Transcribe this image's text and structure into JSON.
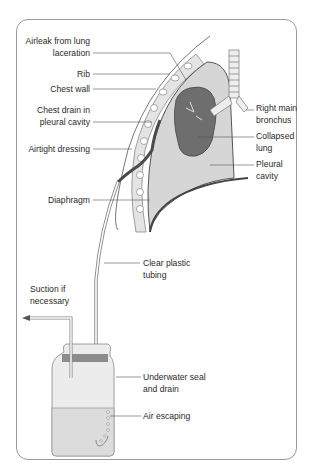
{
  "figure": {
    "labels_left": {
      "airleak": {
        "line1": "Airleak from lung",
        "line2": "laceration"
      },
      "rib": "Rib",
      "chest_wall": "Chest wall",
      "chest_drain": {
        "line1": "Chest drain in",
        "line2": "pleural cavity"
      },
      "airtight_dressing": "Airtight dressing",
      "diaphragm": "Diaphragm",
      "suction": {
        "line1": "Suction if",
        "line2": "necessary"
      }
    },
    "labels_right": {
      "right_main_bronchus": {
        "line1": "Right main",
        "line2": "bronchus"
      },
      "collapsed_lung": {
        "line1": "Collapsed",
        "line2": "lung"
      },
      "pleural_cavity": {
        "line1": "Pleural",
        "line2": "cavity"
      },
      "clear_plastic_tubing": {
        "line1": "Clear plastic",
        "line2": "tubing"
      },
      "underwater_seal": {
        "line1": "Underwater seal",
        "line2": "and drain"
      },
      "air_escaping": "Air escaping"
    },
    "colors": {
      "frame": "#9a9a9a",
      "lung_dark": "#6e6e6e",
      "pleural_fill": "#d6d6d6",
      "chest_wall_fill": "#e4e4e4",
      "tube_dark": "#4a4a4a",
      "jar_fill": "#ececec",
      "water_fill": "#dcdcdc",
      "lid": "#8c8c8c",
      "leader_line": "#555555"
    }
  }
}
